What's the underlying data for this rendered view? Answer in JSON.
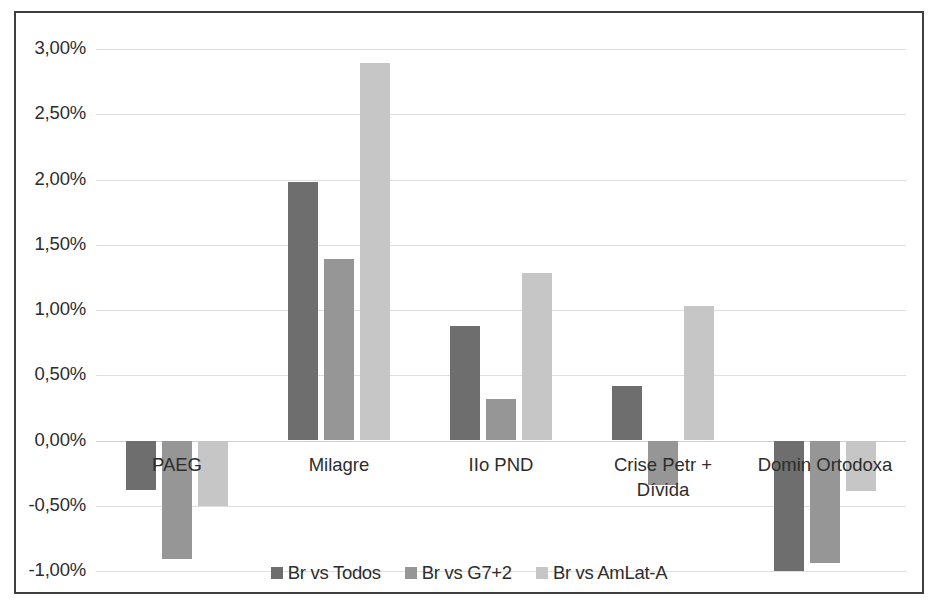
{
  "chart_data": {
    "type": "bar",
    "title": "",
    "xlabel": "",
    "ylabel": "",
    "ylim": [
      -1.0,
      3.0
    ],
    "ytick_step": 0.5,
    "grid": true,
    "legend_position": "bottom",
    "value_suffix": "%",
    "decimal_separator": ",",
    "categories": [
      "PAEG",
      "IIo PND",
      "Milagre",
      "Crise Petr + Dívida",
      "Domin Ortodoxa"
    ],
    "category_labels": [
      {
        "line1": "PAEG",
        "line2": ""
      },
      {
        "line1": "Milagre",
        "line2": ""
      },
      {
        "line1": "IIo PND",
        "line2": ""
      },
      {
        "line1": "Crise Petr +",
        "line2": "Dívida"
      },
      {
        "line1": "Domin Ortodoxa",
        "line2": ""
      }
    ],
    "ordered_categories": [
      "PAEG",
      "Milagre",
      "IIo PND",
      "Crise Petr + Dívida",
      "Domin Ortodoxa"
    ],
    "ytick_labels": [
      "3,00%",
      "2,50%",
      "2,00%",
      "1,50%",
      "1,00%",
      "0,50%",
      "0,00%",
      "-0,50%",
      "-1,00%"
    ],
    "ytick_values": [
      3.0,
      2.5,
      2.0,
      1.5,
      1.0,
      0.5,
      0.0,
      -0.5,
      -1.0
    ],
    "series": [
      {
        "name": "Br vs Todos",
        "color": "#6e6e6e",
        "values": [
          -0.38,
          1.98,
          0.88,
          0.42,
          -1.0
        ]
      },
      {
        "name": "Br vs G7+2",
        "color": "#969696",
        "values": [
          -0.91,
          1.39,
          0.32,
          -0.34,
          -0.94
        ]
      },
      {
        "name": "Br vs AmLat-A",
        "color": "#c6c6c6",
        "values": [
          -0.5,
          2.89,
          1.28,
          1.03,
          -0.39
        ]
      }
    ]
  },
  "frame": {
    "border_color": "#3f3f3f",
    "background": "#ffffff",
    "gridline_color": "#dedede"
  }
}
